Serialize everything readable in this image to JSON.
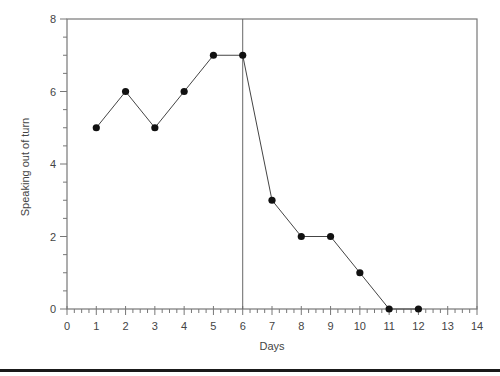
{
  "chart_data": {
    "type": "line",
    "title": "",
    "xlabel": "Days",
    "ylabel": "Speaking out of turn",
    "xlim": [
      0,
      14
    ],
    "ylim": [
      0,
      8
    ],
    "x_ticks": [
      0,
      1,
      2,
      3,
      4,
      5,
      6,
      7,
      8,
      9,
      10,
      11,
      12,
      13,
      14
    ],
    "y_ticks": [
      0,
      2,
      4,
      6,
      8
    ],
    "x_minor_step": 0.25,
    "y_minor_step": 0.5,
    "grid": false,
    "legend": null,
    "phase_line_x": 6,
    "series": [
      {
        "name": "Speaking out of turn",
        "x": [
          1,
          2,
          3,
          4,
          5,
          6,
          7,
          8,
          9,
          10,
          11,
          12
        ],
        "values": [
          5,
          6,
          5,
          6,
          7,
          7,
          3,
          2,
          2,
          1,
          0,
          0
        ],
        "marker": "filled-circle",
        "color": "#111111"
      }
    ],
    "colors": {
      "axis": "#777777",
      "line": "#444444",
      "marker": "#111111",
      "bottom_rule": "#1a1a1a"
    }
  }
}
